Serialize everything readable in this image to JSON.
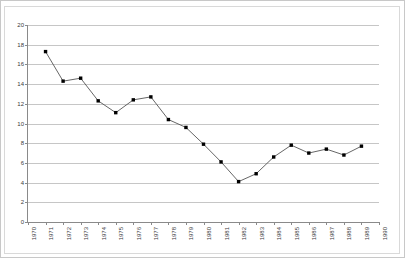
{
  "chart_data": {
    "type": "line",
    "title": "",
    "subtitle": "",
    "xlabel": "",
    "ylabel": "",
    "grid": true,
    "legend": false,
    "legend_position": "none",
    "xlim": [
      1970,
      1990
    ],
    "ylim": [
      0,
      20
    ],
    "ytick_step": 2,
    "yticks": [
      0,
      2,
      4,
      6,
      8,
      10,
      12,
      14,
      16,
      18,
      20
    ],
    "ytick_labels": [
      "0",
      "2",
      "4",
      "6",
      "8",
      "10",
      "12",
      "14",
      "16",
      "18",
      "20"
    ],
    "categories": [
      "1970",
      "1971",
      "1972",
      "1973",
      "1974",
      "1975",
      "1976",
      "1977",
      "1978",
      "1979",
      "1980",
      "1981",
      "1982",
      "1983",
      "1984",
      "1985",
      "1986",
      "1987",
      "1988",
      "1989",
      "1990"
    ],
    "series": [
      {
        "name": "series-1",
        "marker": "square",
        "line_color": "#555555",
        "marker_color": "#000000",
        "x": [
          1971,
          1972,
          1973,
          1974,
          1975,
          1976,
          1977,
          1978,
          1979,
          1980,
          1981,
          1982,
          1983,
          1984,
          1985,
          1986,
          1987,
          1988,
          1989
        ],
        "values": [
          17.3,
          14.3,
          14.6,
          12.3,
          11.1,
          12.4,
          12.7,
          10.4,
          9.6,
          7.9,
          6.1,
          4.1,
          4.9,
          6.6,
          7.8,
          7.0,
          7.4,
          6.8,
          7.7
        ]
      }
    ],
    "annotations": []
  },
  "colors": {
    "gridline": "#c6c6c6",
    "axis": "#8a8a8a",
    "tick_text": "#3a3a3a",
    "line": "#555555",
    "marker": "#000000",
    "background": "#ffffff",
    "frame": "#d9d9d9"
  }
}
